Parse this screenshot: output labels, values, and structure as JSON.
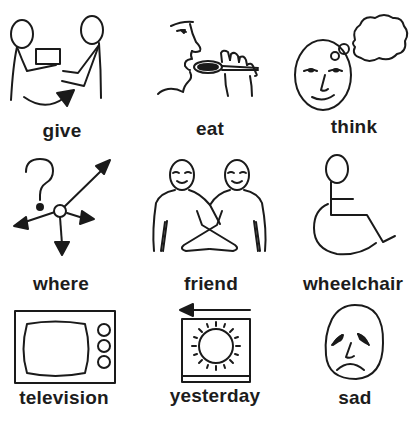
{
  "symbols": [
    {
      "word": "give",
      "icon": "give-icon"
    },
    {
      "word": "eat",
      "icon": "eat-icon"
    },
    {
      "word": "think",
      "icon": "think-icon"
    },
    {
      "word": "where",
      "icon": "where-icon"
    },
    {
      "word": "friend",
      "icon": "friend-icon"
    },
    {
      "word": "wheelchair",
      "icon": "wheelchair-icon"
    },
    {
      "word": "television",
      "icon": "television-icon"
    },
    {
      "word": "yesterday",
      "icon": "yesterday-icon"
    },
    {
      "word": "sad",
      "icon": "sad-icon"
    }
  ],
  "colors": {
    "background": "#ffffff",
    "ink": "#1a1a1a"
  }
}
